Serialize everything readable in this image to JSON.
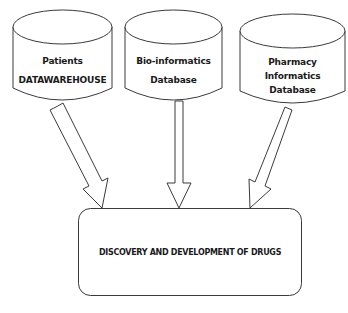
{
  "diagram": {
    "type": "flow",
    "sources": [
      {
        "id": "patients",
        "shape": "cylinder",
        "lines": [
          "Patients",
          "DATAWAREHOUSE"
        ]
      },
      {
        "id": "bioinformatics",
        "shape": "cylinder",
        "lines": [
          "Bio-informatics",
          "Database"
        ]
      },
      {
        "id": "pharmacy",
        "shape": "cylinder",
        "lines": [
          "Pharmacy",
          "Informatics",
          "Database"
        ]
      }
    ],
    "target": {
      "id": "drugs",
      "shape": "rounded-rectangle",
      "label": "DISCOVERY AND DEVELOPMENT OF DRUGS"
    },
    "edges": [
      {
        "from": "patients",
        "to": "drugs",
        "style": "block-arrow"
      },
      {
        "from": "bioinformatics",
        "to": "drugs",
        "style": "block-arrow"
      },
      {
        "from": "pharmacy",
        "to": "drugs",
        "style": "block-arrow"
      }
    ],
    "colors": {
      "stroke": "#3a3a3a",
      "fill": "#ffffff",
      "text": "#1a1a1a"
    }
  }
}
